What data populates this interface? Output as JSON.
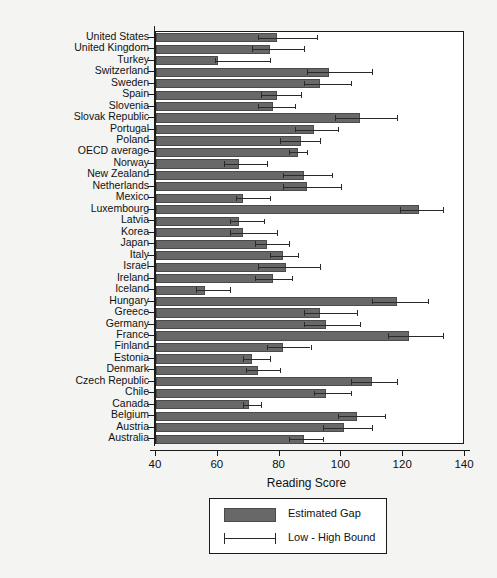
{
  "chart_data": {
    "type": "bar",
    "orientation": "horizontal",
    "title": "",
    "xlabel": "Reading Score",
    "ylabel": "",
    "xlim": [
      40,
      140
    ],
    "xticks": [
      40,
      60,
      80,
      100,
      120,
      140
    ],
    "grid": false,
    "legend_position": "bottom-center",
    "legend": [
      {
        "label": "Estimated Gap",
        "marker": "filled-bar",
        "color": "#686868"
      },
      {
        "label": "Low - High Bound",
        "marker": "error-bar",
        "color": "#2a2a2a"
      }
    ],
    "series": [
      {
        "name": "Estimated Gap",
        "key": "value"
      },
      {
        "name": "Low - High Bound",
        "key": "low_high"
      }
    ],
    "categories": [
      "United States",
      "United Kingdom",
      "Turkey",
      "Switzerland",
      "Sweden",
      "Spain",
      "Slovenia",
      "Slovak Republic",
      "Portugal",
      "Poland",
      "OECD average",
      "Norway",
      "New Zealand",
      "Netherlands",
      "Mexico",
      "Luxembourg",
      "Latvia",
      "Korea",
      "Japan",
      "Italy",
      "Israel",
      "Ireland",
      "Iceland",
      "Hungary",
      "Greece",
      "Germany",
      "France",
      "Finland",
      "Estonia",
      "Denmark",
      "Czech Republic",
      "Chile",
      "Canada",
      "Belgium",
      "Austria",
      "Australia"
    ],
    "points": [
      {
        "category": "United States",
        "value": 79,
        "low": 73,
        "high": 92
      },
      {
        "category": "United Kingdom",
        "value": 77,
        "low": 71,
        "high": 88
      },
      {
        "category": "Turkey",
        "value": 60,
        "low": 59,
        "high": 77
      },
      {
        "category": "Switzerland",
        "value": 96,
        "low": 89,
        "high": 110
      },
      {
        "category": "Sweden",
        "value": 93,
        "low": 88,
        "high": 103
      },
      {
        "category": "Spain",
        "value": 79,
        "low": 74,
        "high": 87
      },
      {
        "category": "Slovenia",
        "value": 78,
        "low": 73,
        "high": 85
      },
      {
        "category": "Slovak Republic",
        "value": 106,
        "low": 98,
        "high": 118
      },
      {
        "category": "Portugal",
        "value": 91,
        "low": 85,
        "high": 99
      },
      {
        "category": "Poland",
        "value": 87,
        "low": 80,
        "high": 93
      },
      {
        "category": "OECD average",
        "value": 86,
        "low": 83,
        "high": 89
      },
      {
        "category": "Norway",
        "value": 67,
        "low": 62,
        "high": 76
      },
      {
        "category": "New Zealand",
        "value": 88,
        "low": 81,
        "high": 97
      },
      {
        "category": "Netherlands",
        "value": 89,
        "low": 81,
        "high": 100
      },
      {
        "category": "Mexico",
        "value": 68,
        "low": 66,
        "high": 77
      },
      {
        "category": "Luxembourg",
        "value": 125,
        "low": 119,
        "high": 133
      },
      {
        "category": "Latvia",
        "value": 67,
        "low": 64,
        "high": 75
      },
      {
        "category": "Korea",
        "value": 68,
        "low": 64,
        "high": 79
      },
      {
        "category": "Japan",
        "value": 76,
        "low": 72,
        "high": 83
      },
      {
        "category": "Italy",
        "value": 81,
        "low": 77,
        "high": 86
      },
      {
        "category": "Israel",
        "value": 82,
        "low": 73,
        "high": 93
      },
      {
        "category": "Ireland",
        "value": 78,
        "low": 72,
        "high": 84
      },
      {
        "category": "Iceland",
        "value": 56,
        "low": 53,
        "high": 64
      },
      {
        "category": "Hungary",
        "value": 118,
        "low": 110,
        "high": 128
      },
      {
        "category": "Greece",
        "value": 93,
        "low": 88,
        "high": 105
      },
      {
        "category": "Germany",
        "value": 95,
        "low": 88,
        "high": 106
      },
      {
        "category": "France",
        "value": 122,
        "low": 115,
        "high": 133
      },
      {
        "category": "Finland",
        "value": 81,
        "low": 76,
        "high": 90
      },
      {
        "category": "Estonia",
        "value": 71,
        "low": 68,
        "high": 77
      },
      {
        "category": "Denmark",
        "value": 73,
        "low": 69,
        "high": 80
      },
      {
        "category": "Czech Republic",
        "value": 110,
        "low": 103,
        "high": 118
      },
      {
        "category": "Chile",
        "value": 95,
        "low": 91,
        "high": 103
      },
      {
        "category": "Canada",
        "value": 70,
        "low": 68,
        "high": 74
      },
      {
        "category": "Belgium",
        "value": 105,
        "low": 99,
        "high": 114
      },
      {
        "category": "Austria",
        "value": 101,
        "low": 94,
        "high": 110
      },
      {
        "category": "Australia",
        "value": 88,
        "low": 83,
        "high": 94
      }
    ]
  }
}
